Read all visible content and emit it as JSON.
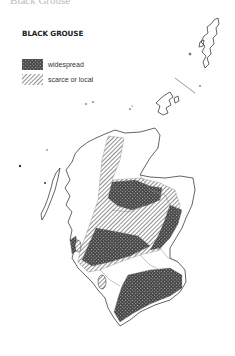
{
  "header": {
    "cut_off_title": "Black Grouse"
  },
  "legend": {
    "title": "BLACK GROUSE",
    "items": [
      {
        "label": "widespread",
        "pattern": "dense-crosshatch",
        "color": "#3a3a3a"
      },
      {
        "label": "scarce or local",
        "pattern": "diagonal-hatch",
        "color": "#555555"
      }
    ]
  },
  "map": {
    "region": "Scotland",
    "outline_color": "#888888",
    "coast_color": "#222222"
  }
}
